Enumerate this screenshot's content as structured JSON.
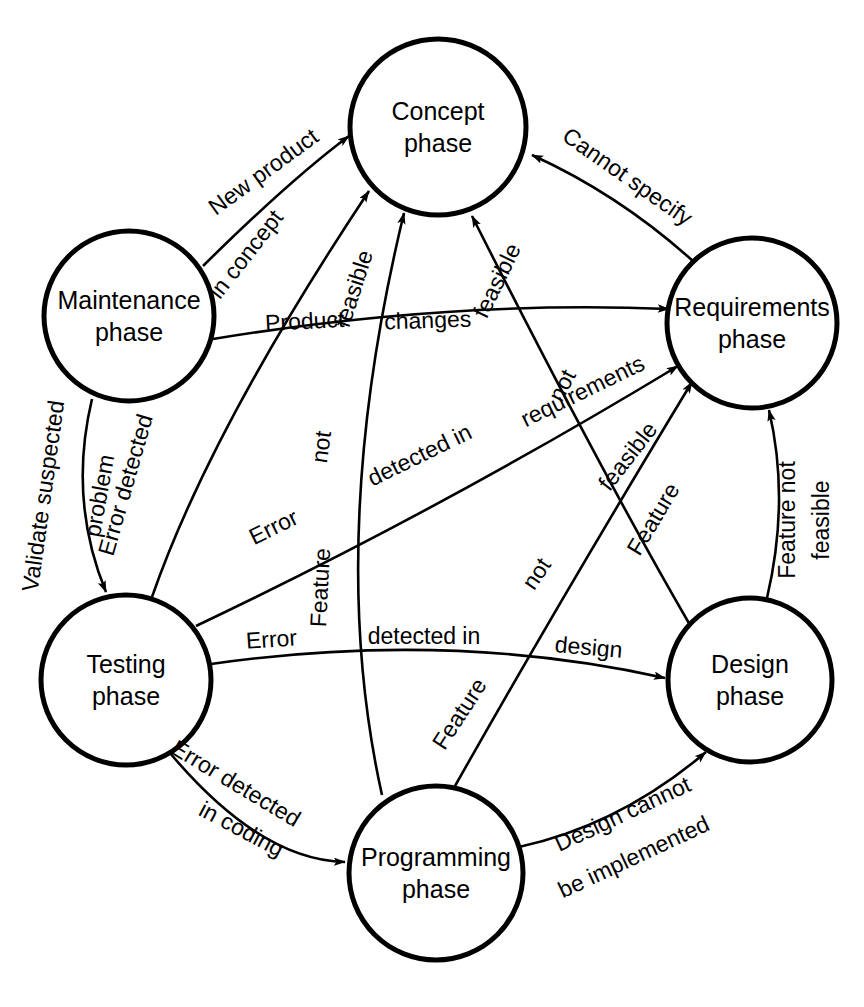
{
  "diagram": {
    "type": "state-transition-diagram",
    "colors": {
      "stroke": "#000000",
      "fill": "#ffffff",
      "background": "#ffffff"
    },
    "nodes": [
      {
        "id": "concept",
        "label_line1": "Concept",
        "label_line2": "phase",
        "cx": 438,
        "cy": 127,
        "r": 88
      },
      {
        "id": "maintenance",
        "label_line1": "Maintenance",
        "label_line2": "phase",
        "cx": 129,
        "cy": 316,
        "r": 85
      },
      {
        "id": "requirements",
        "label_line1": "Requirements",
        "label_line2": "phase",
        "cx": 752,
        "cy": 323,
        "r": 85
      },
      {
        "id": "testing",
        "label_line1": "Testing",
        "label_line2": "phase",
        "cx": 126,
        "cy": 680,
        "r": 85
      },
      {
        "id": "design",
        "label_line1": "Design",
        "label_line2": "phase",
        "cx": 750,
        "cy": 680,
        "r": 82
      },
      {
        "id": "programming",
        "label_line1": "Programming",
        "label_line2": "phase",
        "cx": 436,
        "cy": 873,
        "r": 87
      }
    ],
    "edges": [
      {
        "id": "maintenance-to-concept",
        "from": "maintenance",
        "to": "concept",
        "label": "New product"
      },
      {
        "id": "requirements-to-concept",
        "from": "requirements",
        "to": "concept",
        "label": "Cannot specify"
      },
      {
        "id": "testing-to-concept",
        "from": "testing",
        "to": "concept",
        "label": "Error detected in concept"
      },
      {
        "id": "maintenance-to-requirements",
        "from": "maintenance",
        "to": "requirements",
        "label": "Product changes"
      },
      {
        "id": "testing-to-requirements",
        "from": "testing",
        "to": "requirements",
        "label": "Error detected in requirements"
      },
      {
        "id": "programming-to-concept",
        "from": "programming",
        "to": "concept",
        "label": "Feature not feasible"
      },
      {
        "id": "design-to-concept",
        "from": "design",
        "to": "concept",
        "label": "Feature not feasible"
      },
      {
        "id": "programming-to-requirements",
        "from": "programming",
        "to": "requirements",
        "label": "Feature not feasible"
      },
      {
        "id": "design-to-requirements",
        "from": "design",
        "to": "requirements",
        "label": "Feature not feasible"
      },
      {
        "id": "maintenance-to-testing",
        "from": "maintenance",
        "to": "testing",
        "label": "Validate suspected problem"
      },
      {
        "id": "testing-to-design",
        "from": "testing",
        "to": "design",
        "label": "Error detected in design"
      },
      {
        "id": "testing-to-programming",
        "from": "testing",
        "to": "programming",
        "label": "Error detected in coding"
      },
      {
        "id": "programming-to-design",
        "from": "programming",
        "to": "design",
        "label": "Design cannot be implemented"
      }
    ],
    "edge_label_words": {
      "maintenance_concept": [
        "New product"
      ],
      "requirements_concept": [
        "Cannot specify"
      ],
      "testing_concept_a": [
        "Error detected"
      ],
      "testing_concept_b": [
        "in concept"
      ],
      "maintenance_requirements_a": [
        "Product"
      ],
      "maintenance_requirements_b": [
        "changes"
      ],
      "testing_requirements_a": [
        "Error"
      ],
      "testing_requirements_b": [
        "detected in"
      ],
      "testing_requirements_c": [
        "requirements"
      ],
      "programming_concept_a": [
        "Feature"
      ],
      "programming_concept_b": [
        "not"
      ],
      "programming_concept_c": [
        "feasible"
      ],
      "design_concept_a": [
        "Feature"
      ],
      "design_concept_b": [
        "not"
      ],
      "design_concept_c": [
        "feasible"
      ],
      "programming_requirements_a": [
        "Feature"
      ],
      "programming_requirements_b": [
        "not"
      ],
      "programming_requirements_c": [
        "feasible"
      ],
      "design_requirements_a": [
        "Feature not"
      ],
      "design_requirements_b": [
        "feasible"
      ],
      "maintenance_testing_a": [
        "Validate suspected"
      ],
      "maintenance_testing_b": [
        "problem"
      ],
      "testing_design_a": [
        "Error"
      ],
      "testing_design_b": [
        "detected in"
      ],
      "testing_design_c": [
        "design"
      ],
      "testing_programming_a": [
        "Error detected"
      ],
      "testing_programming_b": [
        "in coding"
      ],
      "programming_design_a": [
        "Design cannot"
      ],
      "programming_design_b": [
        "be implemented"
      ]
    }
  }
}
